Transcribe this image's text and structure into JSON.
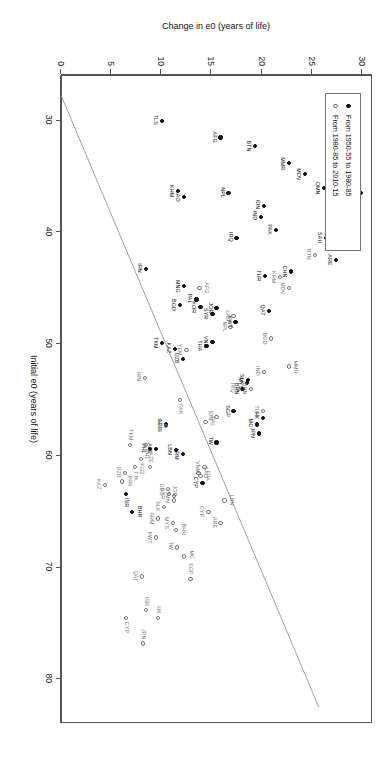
{
  "chart_data": {
    "type": "scatter",
    "title": "",
    "xlabel": "Initial e0 (years of life)",
    "ylabel": "Change in e0 (years of life)",
    "xlim": [
      26,
      84
    ],
    "ylim": [
      0,
      31
    ],
    "xticks": [
      30,
      40,
      50,
      60,
      70,
      80
    ],
    "yticks": [
      0,
      5,
      10,
      15,
      20,
      25,
      30
    ],
    "grid": false,
    "legend_position": "top-left",
    "reference_line": {
      "description": "diagonal guide line",
      "x": [
        27.5,
        82.5
      ],
      "y": [
        0,
        25.8
      ]
    },
    "series": [
      {
        "name": "From 1950-55 to 1980-85",
        "marker": "filled-circle",
        "color": "#111111",
        "points": [
          {
            "label": "YEM",
            "x": 29.0,
            "y": 27.5,
            "lp": "r"
          },
          {
            "label": "PRK",
            "x": 36.5,
            "y": 30.0,
            "lp": "b"
          },
          {
            "label": "OMN",
            "x": 36.0,
            "y": 26.3,
            "lp": "b"
          },
          {
            "label": "MDV",
            "x": 34.8,
            "y": 24.4,
            "lp": "b"
          },
          {
            "label": "MMR",
            "x": 33.8,
            "y": 22.8,
            "lp": "b"
          },
          {
            "label": "BHR",
            "x": 39.5,
            "y": 28.0,
            "lp": "b"
          },
          {
            "label": "ARE",
            "x": 42.5,
            "y": 27.5,
            "lp": "b"
          },
          {
            "label": "SAU",
            "x": 40.5,
            "y": 26.5,
            "lp": "b"
          },
          {
            "label": "IDN",
            "x": 37.6,
            "y": 20.3,
            "lp": "b"
          },
          {
            "label": "PAK",
            "x": 39.8,
            "y": 21.5,
            "lp": "b"
          },
          {
            "label": "IND",
            "x": 38.6,
            "y": 20.0,
            "lp": "b"
          },
          {
            "label": "CHN",
            "x": 43.5,
            "y": 23.0,
            "lp": "b"
          },
          {
            "label": "BTN",
            "x": 32.3,
            "y": 19.4,
            "lp": "b"
          },
          {
            "label": "AFG",
            "x": 31.5,
            "y": 16.0,
            "lp": "b"
          },
          {
            "label": "NPL",
            "x": 36.5,
            "y": 16.8,
            "lp": "b"
          },
          {
            "label": "TUR",
            "x": 43.9,
            "y": 20.4,
            "lp": "b"
          },
          {
            "label": "IRQ",
            "x": 40.5,
            "y": 17.6,
            "lp": "b"
          },
          {
            "label": "TLS",
            "x": 30.0,
            "y": 10.2,
            "lp": "b"
          },
          {
            "label": "LAO",
            "x": 36.8,
            "y": 12.4,
            "lp": "b"
          },
          {
            "label": "KHM",
            "x": 36.3,
            "y": 11.8,
            "lp": "b"
          },
          {
            "label": "IRN",
            "x": 43.3,
            "y": 8.6,
            "lp": "b"
          },
          {
            "label": "MNG",
            "x": 44.8,
            "y": 12.4,
            "lp": "b"
          },
          {
            "label": "BGD",
            "x": 46.5,
            "y": 12.0,
            "lp": "b"
          },
          {
            "label": "QAT",
            "x": 47.0,
            "y": 20.8,
            "lp": "b"
          },
          {
            "label": "KWT",
            "x": 48.0,
            "y": 17.5,
            "lp": "b"
          },
          {
            "label": "JOR",
            "x": 46.8,
            "y": 15.6,
            "lp": "b"
          },
          {
            "label": "SYR",
            "x": 47.3,
            "y": 15.2,
            "lp": "b"
          },
          {
            "label": "KOR",
            "x": 46.7,
            "y": 14.0,
            "lp": "b"
          },
          {
            "label": "PAL",
            "x": 46.0,
            "y": 13.6,
            "lp": "b"
          },
          {
            "label": "VNM",
            "x": 49.8,
            "y": 15.2,
            "lp": "b"
          },
          {
            "label": "THA",
            "x": 50.2,
            "y": 14.6,
            "lp": "b"
          },
          {
            "label": "KAZ",
            "x": 50.4,
            "y": 11.5,
            "lp": "b"
          },
          {
            "label": "TKM",
            "x": 49.9,
            "y": 10.2,
            "lp": "b"
          },
          {
            "label": "UZB",
            "x": 51.3,
            "y": 12.3,
            "lp": "b"
          },
          {
            "label": "MYS",
            "x": 53.5,
            "y": 18.6,
            "lp": "b"
          },
          {
            "label": "SLK",
            "x": 53.2,
            "y": 18.7,
            "lp": "b"
          },
          {
            "label": "BRN",
            "x": 54.0,
            "y": 18.2,
            "lp": "b"
          },
          {
            "label": "SGP",
            "x": 56.0,
            "y": 17.3,
            "lp": "b"
          },
          {
            "label": "HK",
            "x": 56.6,
            "y": 20.2,
            "lp": "b"
          },
          {
            "label": "MC",
            "x": 57.2,
            "y": 19.6,
            "lp": "b"
          },
          {
            "label": "JPN",
            "x": 58.0,
            "y": 19.8,
            "lp": "b"
          },
          {
            "label": "TW",
            "x": 58.8,
            "y": 15.6,
            "lp": "b"
          },
          {
            "label": "ARM",
            "x": 59.8,
            "y": 12.3,
            "lp": "b"
          },
          {
            "label": "LBN",
            "x": 59.5,
            "y": 11.6,
            "lp": "b"
          },
          {
            "label": "GEO",
            "x": 57.2,
            "y": 10.6,
            "lp": "b"
          },
          {
            "label": "AZE",
            "x": 59.4,
            "y": 9.6,
            "lp": "b"
          },
          {
            "label": "PHL",
            "x": 59.4,
            "y": 9.0,
            "lp": "b"
          },
          {
            "label": "CYP",
            "x": 62.4,
            "y": 14.2,
            "lp": "b"
          },
          {
            "label": "ISR",
            "x": 63.4,
            "y": 6.6,
            "lp": "r"
          },
          {
            "label": "BHR",
            "x": 65.0,
            "y": 7.2,
            "lp": "t"
          }
        ]
      },
      {
        "name": "From 1980-85 to 2010-15",
        "marker": "open-circle",
        "color": "#777777",
        "points": [
          {
            "label": "TLS",
            "x": 38.5,
            "y": 27.6,
            "lp": "b"
          },
          {
            "label": "BTN",
            "x": 42.0,
            "y": 25.4,
            "lp": "b"
          },
          {
            "label": "AFG",
            "x": 45.0,
            "y": 13.9,
            "lp": "t"
          },
          {
            "label": "KHM",
            "x": 44.0,
            "y": 21.9,
            "lp": "b"
          },
          {
            "label": "MDV",
            "x": 45.0,
            "y": 22.8,
            "lp": "b"
          },
          {
            "label": "LAO",
            "x": 47.5,
            "y": 17.3,
            "lp": "b"
          },
          {
            "label": "NPL",
            "x": 48.5,
            "y": 17.0,
            "lp": "b"
          },
          {
            "label": "BGD",
            "x": 49.5,
            "y": 21.0,
            "lp": "b"
          },
          {
            "label": "YEM",
            "x": 50.5,
            "y": 12.6,
            "lp": "b"
          },
          {
            "label": "IRN",
            "x": 53.0,
            "y": 8.5,
            "lp": "b"
          },
          {
            "label": "BRN",
            "x": 54.0,
            "y": 19.0,
            "lp": "b"
          },
          {
            "label": "MMR",
            "x": 52.0,
            "y": 22.8,
            "lp": "t"
          },
          {
            "label": "IND",
            "x": 52.5,
            "y": 20.3,
            "lp": "b"
          },
          {
            "label": "IRQ",
            "x": 54.0,
            "y": 17.8,
            "lp": "b"
          },
          {
            "label": "PAK",
            "x": 55.0,
            "y": 12.0,
            "lp": "r"
          },
          {
            "label": "TUR",
            "x": 56.0,
            "y": 20.2,
            "lp": "b"
          },
          {
            "label": "IDN",
            "x": 56.5,
            "y": 15.6,
            "lp": "b"
          },
          {
            "label": "PAL",
            "x": 57.0,
            "y": 14.5,
            "lp": "t"
          },
          {
            "label": "MNG",
            "x": 57.3,
            "y": 10.6,
            "lp": "b"
          },
          {
            "label": "PHL",
            "x": 59.0,
            "y": 8.6,
            "lp": "r"
          },
          {
            "label": "KGZ",
            "x": 60.3,
            "y": 8.1,
            "lp": "r"
          },
          {
            "label": "TJK",
            "x": 61.0,
            "y": 7.5,
            "lp": "r"
          },
          {
            "label": "TKM",
            "x": 59.0,
            "y": 7.0,
            "lp": "l"
          },
          {
            "label": "UZB",
            "x": 61.5,
            "y": 6.5,
            "lp": "b"
          },
          {
            "label": "PRK",
            "x": 62.3,
            "y": 6.2,
            "lp": "t"
          },
          {
            "label": "KAZ",
            "x": 62.6,
            "y": 4.5,
            "lp": "b"
          },
          {
            "label": "VNM",
            "x": 61.0,
            "y": 14.4,
            "lp": "b"
          },
          {
            "label": "THA",
            "x": 61.8,
            "y": 14.0,
            "lp": "t"
          },
          {
            "label": "SAU",
            "x": 61.5,
            "y": 13.8,
            "lp": "t"
          },
          {
            "label": "AZE",
            "x": 61.0,
            "y": 9.0,
            "lp": "l"
          },
          {
            "label": "GEO",
            "x": 63.0,
            "y": 10.8,
            "lp": "b"
          },
          {
            "label": "OMN",
            "x": 63.6,
            "y": 11.4,
            "lp": "b"
          },
          {
            "label": "SYR",
            "x": 63.4,
            "y": 10.9,
            "lp": "b"
          },
          {
            "label": "JOR",
            "x": 64.0,
            "y": 11.4,
            "lp": "l"
          },
          {
            "label": "SLK",
            "x": 64.6,
            "y": 10.4,
            "lp": "b"
          },
          {
            "label": "ARM",
            "x": 65.6,
            "y": 9.8,
            "lp": "b"
          },
          {
            "label": "LBN",
            "x": 64.0,
            "y": 16.4,
            "lp": "t"
          },
          {
            "label": "CYP",
            "x": 65.0,
            "y": 14.8,
            "lp": "b"
          },
          {
            "label": "MYS",
            "x": 66.0,
            "y": 11.3,
            "lp": "b"
          },
          {
            "label": "BHR",
            "x": 66.6,
            "y": 11.6,
            "lp": "t"
          },
          {
            "label": "KWT",
            "x": 67.3,
            "y": 9.6,
            "lp": "b"
          },
          {
            "label": "ARE",
            "x": 66.0,
            "y": 16.0,
            "lp": "b"
          },
          {
            "label": "QAT",
            "x": 70.8,
            "y": 8.2,
            "lp": "b"
          },
          {
            "label": "SGP",
            "x": 71.0,
            "y": 13.0,
            "lp": "l"
          },
          {
            "label": "TW",
            "x": 68.2,
            "y": 11.7,
            "lp": "b"
          },
          {
            "label": "MC",
            "x": 69.0,
            "y": 12.4,
            "lp": "t"
          },
          {
            "label": "ISR",
            "x": 73.8,
            "y": 8.6,
            "lp": "l"
          },
          {
            "label": "HK",
            "x": 74.5,
            "y": 9.8,
            "lp": "l"
          },
          {
            "label": "JPN",
            "x": 76.8,
            "y": 8.3,
            "lp": "l"
          },
          {
            "label": "CYP",
            "x": 74.5,
            "y": 6.6,
            "lp": "r"
          }
        ]
      }
    ]
  },
  "legend": {
    "entries": [
      {
        "label": "From 1950-55 to 1980-85",
        "marker": "filled-circle"
      },
      {
        "label": "From 1980-85 to 2010-15",
        "marker": "open-circle"
      }
    ]
  }
}
